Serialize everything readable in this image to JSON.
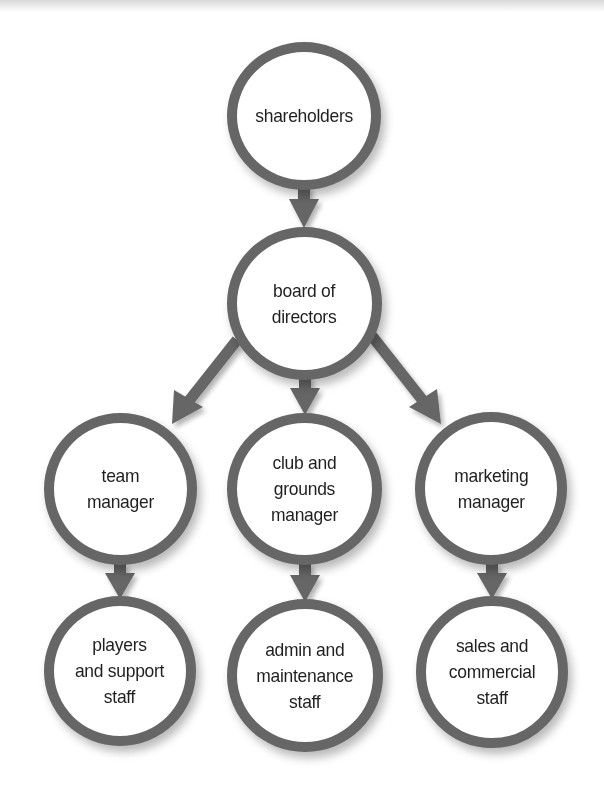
{
  "diagram": {
    "type": "organization-chart",
    "colors": {
      "ring": "#666666",
      "arrow": "#666666",
      "fill": "#ffffff",
      "text": "#1f1f1f"
    },
    "nodes": [
      {
        "id": "shareholders",
        "label": "shareholders",
        "level": 0
      },
      {
        "id": "board",
        "label": "board of\ndirectors",
        "level": 1
      },
      {
        "id": "team_manager",
        "label": "team\nmanager",
        "level": 2
      },
      {
        "id": "club_grounds_manager",
        "label": "club and\ngrounds\nmanager",
        "level": 2
      },
      {
        "id": "marketing_manager",
        "label": "marketing\nmanager",
        "level": 2
      },
      {
        "id": "players_support_staff",
        "label": "players\nand support\nstaff",
        "level": 3
      },
      {
        "id": "admin_maintenance_staff",
        "label": "admin and\nmaintenance\nstaff",
        "level": 3
      },
      {
        "id": "sales_commercial_staff",
        "label": "sales and\ncommercial\nstaff",
        "level": 3
      }
    ],
    "edges": [
      {
        "from": "shareholders",
        "to": "board"
      },
      {
        "from": "board",
        "to": "team_manager"
      },
      {
        "from": "board",
        "to": "club_grounds_manager"
      },
      {
        "from": "board",
        "to": "marketing_manager"
      },
      {
        "from": "team_manager",
        "to": "players_support_staff"
      },
      {
        "from": "club_grounds_manager",
        "to": "admin_maintenance_staff"
      },
      {
        "from": "marketing_manager",
        "to": "sales_commercial_staff"
      }
    ]
  }
}
